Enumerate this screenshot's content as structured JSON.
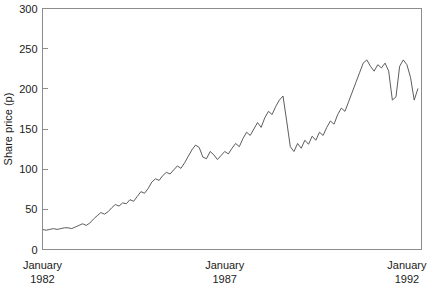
{
  "chart_data": {
    "type": "line",
    "title": "",
    "xlabel": "",
    "ylabel": "Share price (p)",
    "ylim": [
      0,
      300
    ],
    "xlim": [
      1982.0,
      1992.4
    ],
    "grid": false,
    "legend": null,
    "y_ticks": [
      0,
      50,
      100,
      150,
      200,
      250,
      300
    ],
    "y_tick_labels": [
      "0",
      "50",
      "100",
      "150",
      "200",
      "250",
      "300"
    ],
    "x_ticks": [
      1982.0,
      1987.0,
      1992.0
    ],
    "x_tick_labels": [
      {
        "line1": "January",
        "line2": "1982"
      },
      {
        "line1": "January",
        "line2": "1987"
      },
      {
        "line1": "January",
        "line2": "1992"
      }
    ],
    "series": [
      {
        "name": "Share price",
        "color": "#4a4a4a",
        "x": [
          1982.0,
          1982.1,
          1982.2,
          1982.3,
          1982.4,
          1982.5,
          1982.6,
          1982.7,
          1982.8,
          1982.9,
          1983.0,
          1983.1,
          1983.2,
          1983.3,
          1983.4,
          1983.5,
          1983.6,
          1983.7,
          1983.8,
          1983.9,
          1984.0,
          1984.1,
          1984.2,
          1984.3,
          1984.4,
          1984.5,
          1984.6,
          1984.7,
          1984.8,
          1984.9,
          1985.0,
          1985.1,
          1985.2,
          1985.3,
          1985.4,
          1985.5,
          1985.6,
          1985.7,
          1985.8,
          1985.9,
          1986.0,
          1986.1,
          1986.2,
          1986.3,
          1986.4,
          1986.5,
          1986.6,
          1986.7,
          1986.8,
          1986.9,
          1987.0,
          1987.1,
          1987.2,
          1987.3,
          1987.4,
          1987.5,
          1987.6,
          1987.7,
          1987.8,
          1987.9,
          1988.0,
          1988.1,
          1988.2,
          1988.3,
          1988.4,
          1988.5,
          1988.6,
          1988.7,
          1988.8,
          1988.9,
          1989.0,
          1989.1,
          1989.2,
          1989.3,
          1989.4,
          1989.5,
          1989.6,
          1989.7,
          1989.8,
          1989.9,
          1990.0,
          1990.1,
          1990.2,
          1990.3,
          1990.4,
          1990.5,
          1990.6,
          1990.7,
          1990.8,
          1990.9,
          1991.0,
          1991.1,
          1991.2,
          1991.3,
          1991.4,
          1991.5,
          1991.6,
          1991.7,
          1991.8,
          1991.9,
          1992.0,
          1992.1,
          1992.2,
          1992.3
        ],
        "y": [
          25,
          24,
          25,
          26,
          25,
          26,
          27,
          27,
          26,
          28,
          30,
          32,
          30,
          33,
          38,
          42,
          46,
          44,
          47,
          52,
          56,
          54,
          58,
          57,
          62,
          60,
          66,
          72,
          70,
          76,
          84,
          88,
          86,
          92,
          96,
          94,
          99,
          104,
          101,
          108,
          116,
          124,
          130,
          127,
          115,
          113,
          122,
          118,
          112,
          117,
          122,
          119,
          126,
          132,
          128,
          138,
          146,
          142,
          150,
          158,
          152,
          164,
          172,
          168,
          178,
          186,
          191,
          160,
          128,
          122,
          132,
          126,
          136,
          131,
          141,
          136,
          146,
          142,
          152,
          160,
          156,
          168,
          176,
          172,
          184,
          196,
          208,
          220,
          232,
          236,
          228,
          222,
          230,
          226,
          232,
          222,
          186,
          190,
          228,
          236,
          230,
          214,
          186,
          200
        ]
      }
    ]
  },
  "figure": {
    "background_color": "#ffffff",
    "frame_color": "#8c8c8c"
  }
}
